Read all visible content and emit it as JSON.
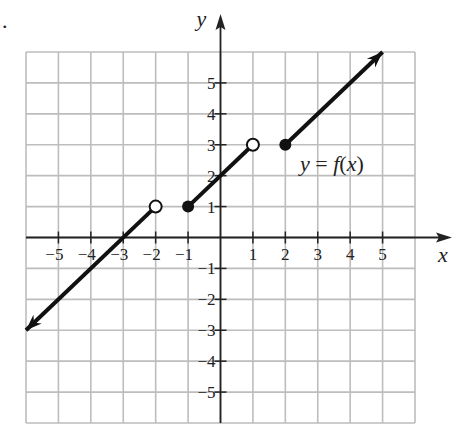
{
  "figure": {
    "marker": ".",
    "x_axis_label": "x",
    "y_axis_label": "y",
    "function_label": "y = f(x)"
  },
  "chart_data": {
    "type": "line",
    "title": "",
    "xlabel": "x",
    "ylabel": "y",
    "xlim": [
      -6,
      6
    ],
    "ylim": [
      -6,
      6
    ],
    "grid": true,
    "x_ticks": [
      -5,
      -4,
      -3,
      -2,
      -1,
      1,
      2,
      3,
      4,
      5
    ],
    "y_ticks": [
      -5,
      -4,
      -3,
      -2,
      -1,
      1,
      2,
      3,
      4,
      5
    ],
    "annotations": [
      {
        "text": "y = f(x)",
        "x": 3.5,
        "y": 2.2
      }
    ],
    "series": [
      {
        "name": "piece 1",
        "points": [
          [
            -6,
            -3
          ],
          [
            -2,
            1
          ]
        ],
        "start": "arrow",
        "end": "open"
      },
      {
        "name": "piece 2",
        "points": [
          [
            -1,
            1
          ],
          [
            1,
            3
          ]
        ],
        "start": "closed",
        "end": "open"
      },
      {
        "name": "piece 3",
        "points": [
          [
            2,
            3
          ],
          [
            5,
            6
          ]
        ],
        "start": "closed",
        "end": "arrow"
      }
    ]
  }
}
